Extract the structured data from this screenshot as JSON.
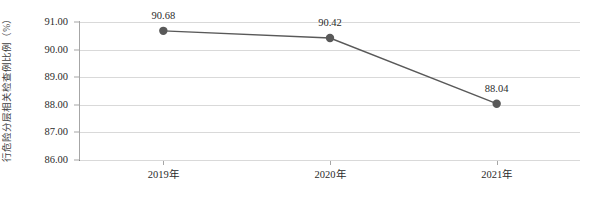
{
  "chart_data": {
    "type": "line",
    "title": "",
    "xlabel": "",
    "ylabel": "行危险分层相关检查例比例（%）",
    "categories": [
      "2019年",
      "2020年",
      "2021年"
    ],
    "values": [
      90.68,
      90.42,
      88.04
    ],
    "data_labels": [
      "90.68",
      "90.42",
      "88.04"
    ],
    "ylim": [
      86.0,
      91.0
    ],
    "ytick_labels": [
      "91.00",
      "90.00",
      "89.00",
      "88.00",
      "87.00",
      "86.00"
    ],
    "ytick_values": [
      91.0,
      90.0,
      89.0,
      88.0,
      87.0,
      86.0
    ],
    "grid": true,
    "legend": "none",
    "series": [
      {
        "name": "行危险分层相关检查例比例（%）",
        "values": [
          90.68,
          90.42,
          88.04
        ]
      }
    ],
    "colors": {
      "line": "#595959",
      "marker": "#595959",
      "gridline": "#d9d9d9",
      "axis": "#808080",
      "text": "#2b2b2b",
      "background": "#ffffff"
    }
  }
}
